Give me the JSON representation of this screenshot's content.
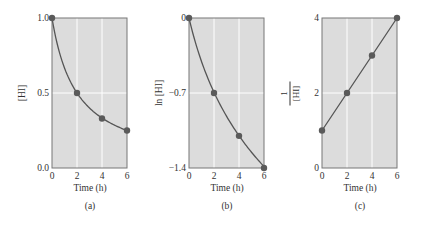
{
  "colors": {
    "plot_background": "#dcdcdc",
    "gridline": "#ffffff",
    "curve": "#555555",
    "marker": "#5a5a5a",
    "frame": "#777777"
  },
  "chart_data": [
    {
      "type": "line",
      "panel_label": "(a)",
      "title": "",
      "xlabel": "Time (h)",
      "ylabel": "[HI]",
      "x": [
        0,
        2,
        4,
        6
      ],
      "series": [
        {
          "name": "[HI]",
          "values": [
            1.0,
            0.5,
            0.33,
            0.25
          ]
        }
      ],
      "xlim": [
        0,
        6
      ],
      "ylim": [
        0.0,
        1.0
      ],
      "xticks": [
        "0",
        "2",
        "4",
        "6"
      ],
      "yticks": [
        "0.0",
        "0.5",
        "1.0"
      ],
      "grid": true,
      "curve": "smooth decay"
    },
    {
      "type": "line",
      "panel_label": "(b)",
      "title": "",
      "xlabel": "Time (h)",
      "ylabel": "ln [HI]",
      "x": [
        0,
        2,
        4,
        6
      ],
      "series": [
        {
          "name": "ln [HI]",
          "values": [
            0.0,
            -0.7,
            -1.1,
            -1.4
          ]
        }
      ],
      "xlim": [
        0,
        6
      ],
      "ylim": [
        -1.4,
        0
      ],
      "xticks": [
        "0",
        "2",
        "4",
        "6"
      ],
      "yticks": [
        "−1.4",
        "−0.7",
        "0"
      ],
      "grid": true,
      "curve": "smooth decay"
    },
    {
      "type": "line",
      "panel_label": "(c)",
      "title": "",
      "xlabel": "Time (h)",
      "ylabel": "1/[HI]",
      "ylabel_numerator": "1",
      "ylabel_denominator": "[HI]",
      "x": [
        0,
        2,
        4,
        6
      ],
      "series": [
        {
          "name": "1/[HI]",
          "values": [
            1,
            2,
            3,
            4
          ]
        }
      ],
      "xlim": [
        0,
        6
      ],
      "ylim": [
        0,
        4
      ],
      "xticks": [
        "0",
        "2",
        "4",
        "6"
      ],
      "yticks": [
        "0",
        "2",
        "4"
      ],
      "grid": true,
      "curve": "straight line"
    }
  ]
}
